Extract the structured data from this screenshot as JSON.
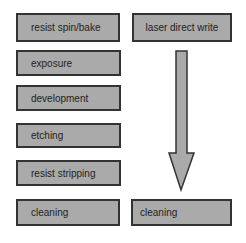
{
  "diagram": {
    "left_column": [
      {
        "label": "resist spin/bake"
      },
      {
        "label": "exposure"
      },
      {
        "label": "development"
      },
      {
        "label": "etching"
      },
      {
        "label": "resist stripping"
      },
      {
        "label": "cleaning"
      }
    ],
    "right_column": {
      "top": {
        "label": "laser direct write"
      },
      "bottom": {
        "label": "cleaning"
      },
      "arrow": "down-arrow"
    },
    "colors": {
      "box_fill": "#aaaaaa",
      "box_border": "#333333",
      "arrow_fill": "#aaaaaa"
    }
  }
}
